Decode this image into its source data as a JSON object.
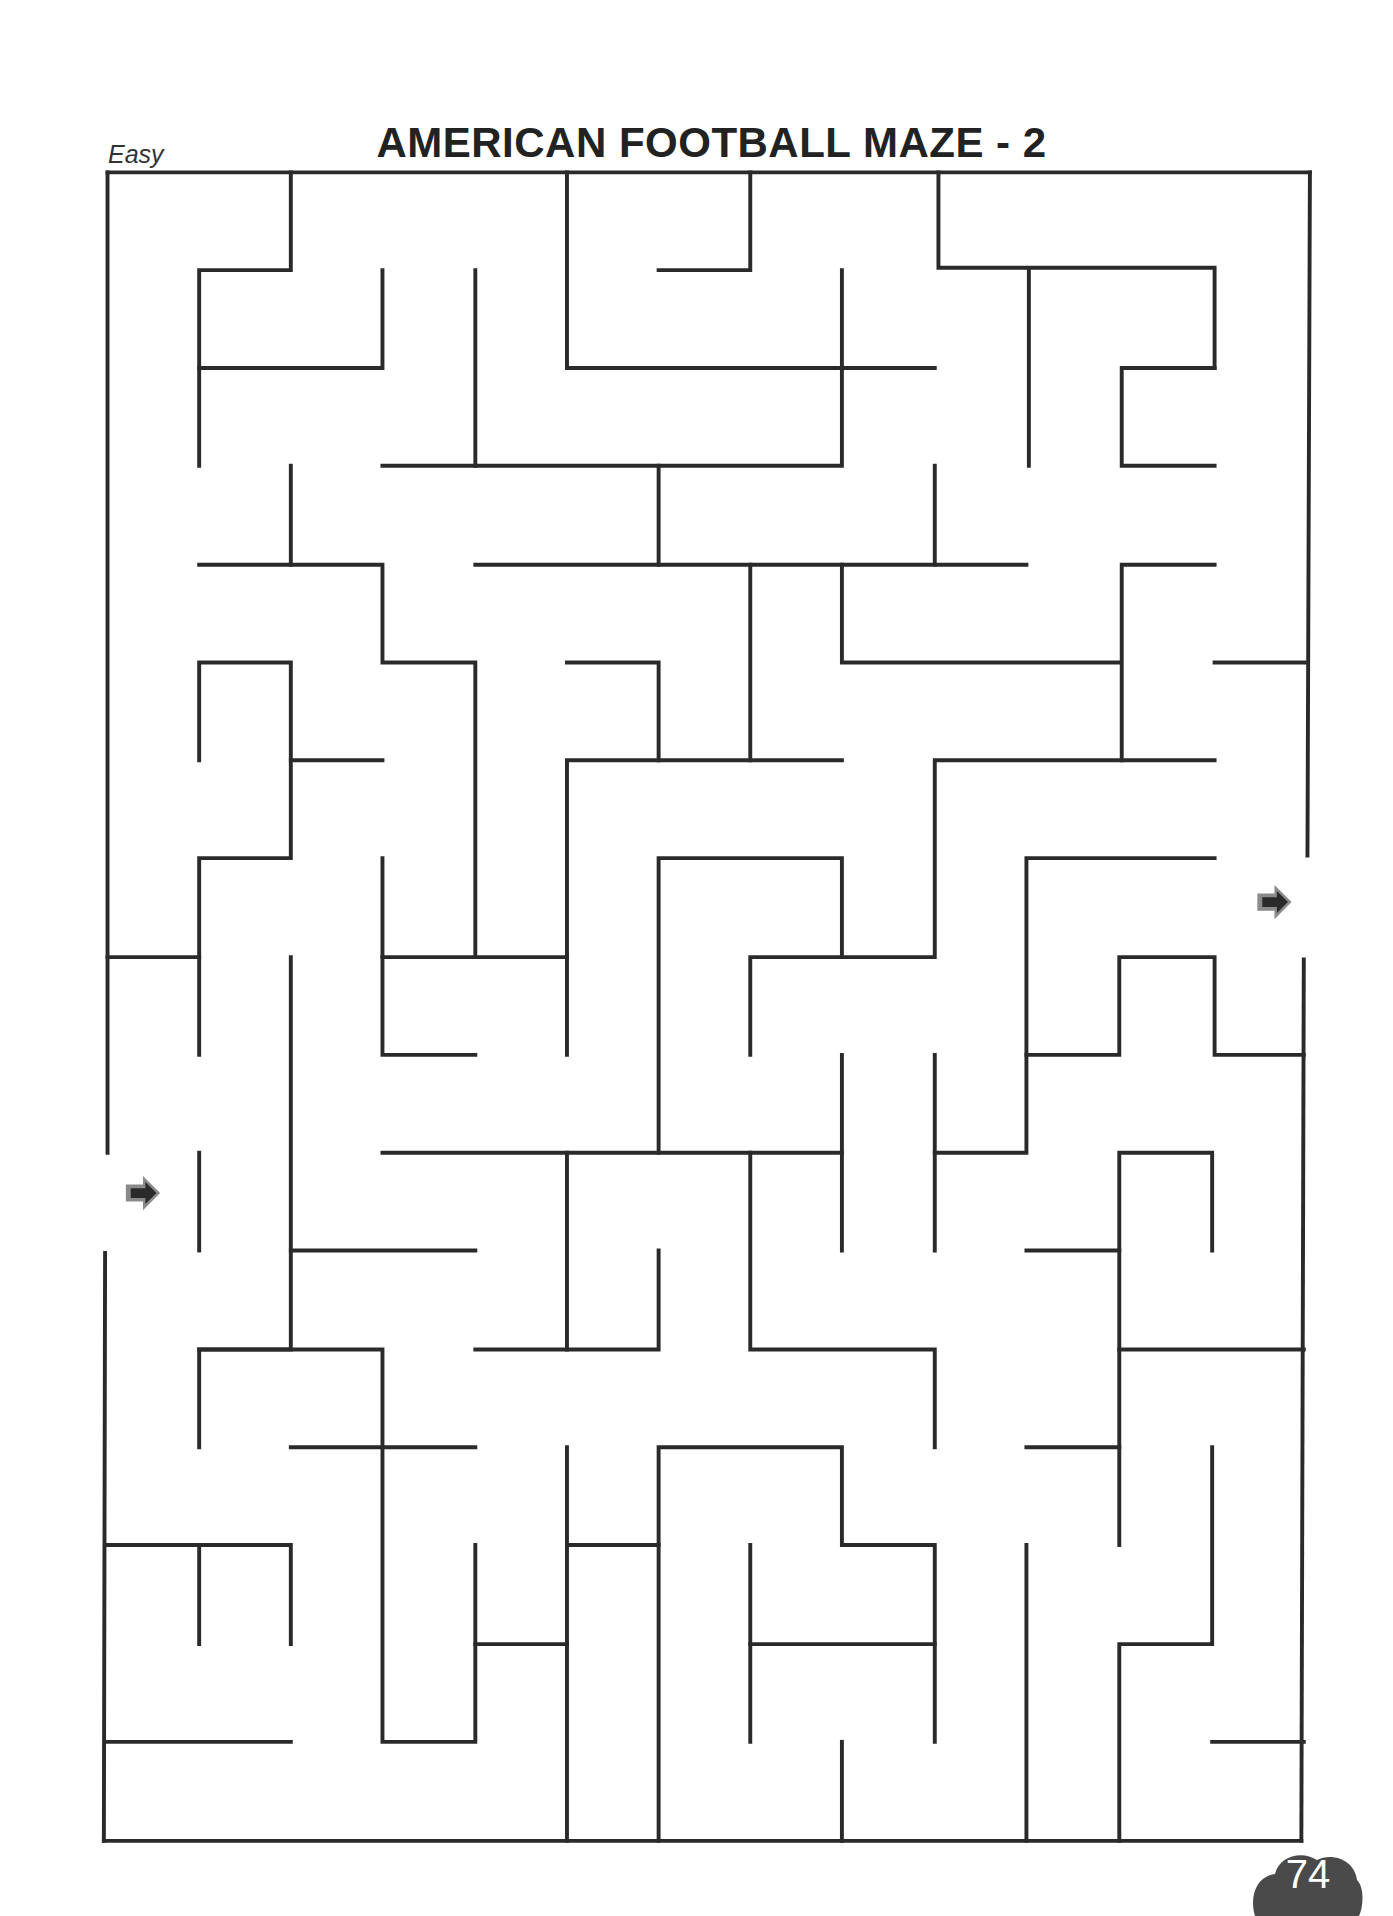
{
  "header": {
    "difficulty": "Easy",
    "title": "AMERICAN FOOTBALL MAZE - 2"
  },
  "maze": {
    "wall_color": "#2a2a2a",
    "entrance": {
      "side": "left",
      "icon": "arrow-right-icon"
    },
    "exit": {
      "side": "right",
      "icon": "arrow-right-icon"
    },
    "grid": {
      "columns": 13,
      "rows": 17
    }
  },
  "footer": {
    "page_number": "74",
    "badge_color": "#4a4a4a"
  }
}
